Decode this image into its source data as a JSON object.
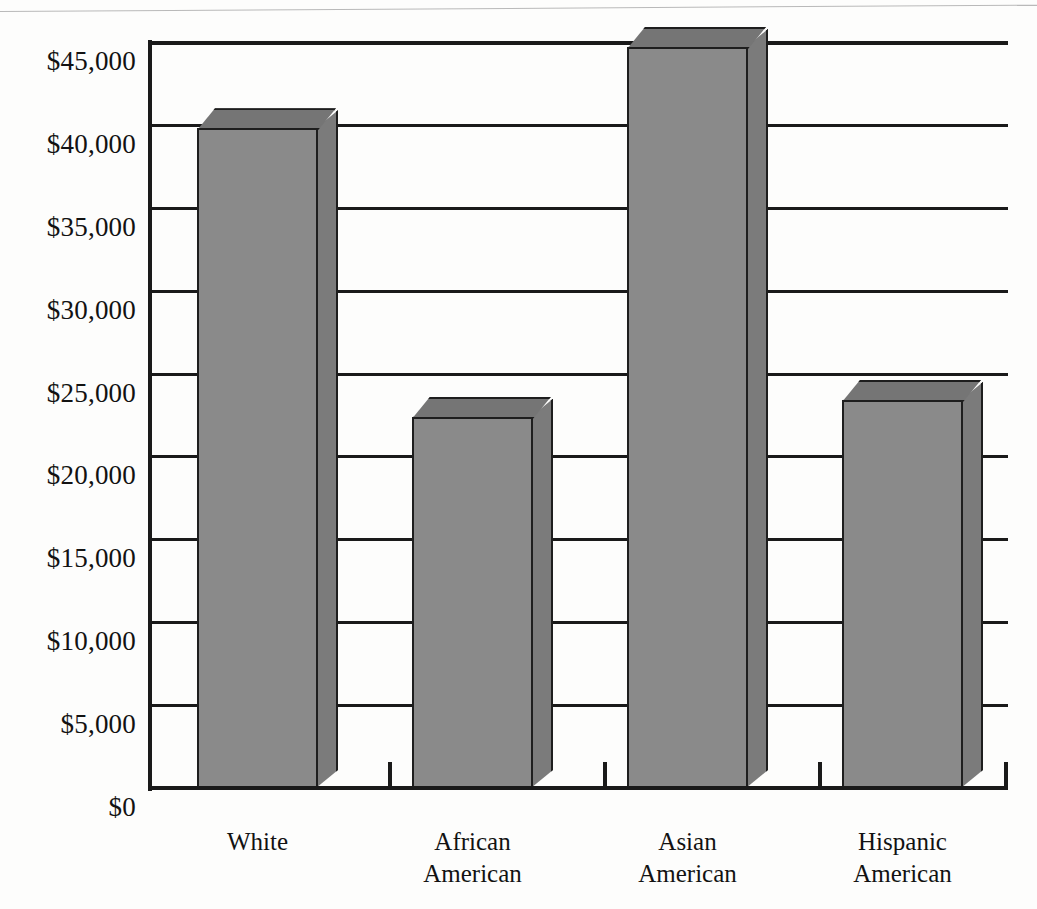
{
  "chart_data": {
    "type": "bar",
    "title": "",
    "subtitle": "",
    "xlabel": "",
    "ylabel": "",
    "categories": [
      "White",
      "African American",
      "Asian American",
      "Hispanic American"
    ],
    "category_lines": [
      [
        "White"
      ],
      [
        "African",
        "American"
      ],
      [
        "Asian",
        "American"
      ],
      [
        "Hispanic",
        "American"
      ]
    ],
    "values": [
      39800,
      22400,
      44700,
      23400
    ],
    "value_labels": [
      "",
      "",
      "",
      ""
    ],
    "ylim": [
      0,
      45000
    ],
    "ytick_values": [
      0,
      5000,
      10000,
      15000,
      20000,
      25000,
      30000,
      35000,
      40000,
      45000
    ],
    "ytick_labels": [
      "$0",
      "$5,000",
      "$10,000",
      "$15,000",
      "$20,000",
      "$25,000",
      "$30,000",
      "$35,000",
      "$40,000",
      "$45,000"
    ],
    "grid": true,
    "grid_axis": "y",
    "legend": false,
    "legend_position": "none",
    "style": "3d-rectangular-bars",
    "annotations": []
  },
  "appearance": {
    "bar_front_color": "#8a8a8a",
    "bar_side_color": "#7b7b7b",
    "bar_top_color": "#757575",
    "outline_color": "#1e1e1e",
    "grid_color": "#1a1a1a",
    "background_color": "#fdfdfc",
    "text_color": "#121212"
  }
}
